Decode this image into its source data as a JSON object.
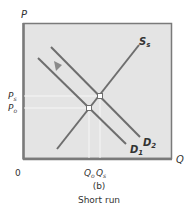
{
  "diagram": {
    "panel_label": "(b)",
    "caption": "Short run",
    "axes": {
      "y_label": "P",
      "x_label": "Q",
      "origin_label": "0"
    },
    "price_ticks": [
      {
        "label": "P",
        "sub": "s"
      },
      {
        "label": "P",
        "sub": "o"
      }
    ],
    "quantity_ticks": [
      {
        "label": "Q",
        "sub": "o"
      },
      {
        "label": "Q",
        "sub": "s"
      }
    ],
    "curves": {
      "supply": {
        "label": "S",
        "sub": "s"
      },
      "demand_1": {
        "label": "D",
        "sub": "1"
      },
      "demand_2": {
        "label": "D",
        "sub": "2"
      }
    },
    "colors": {
      "background_panel": "#e4e4e4",
      "frame": "#7a7a7a",
      "curve": "#6e6e6e",
      "guide": "#f6f6f6",
      "arrow": "#8a8a8a",
      "text": "#333333"
    }
  }
}
